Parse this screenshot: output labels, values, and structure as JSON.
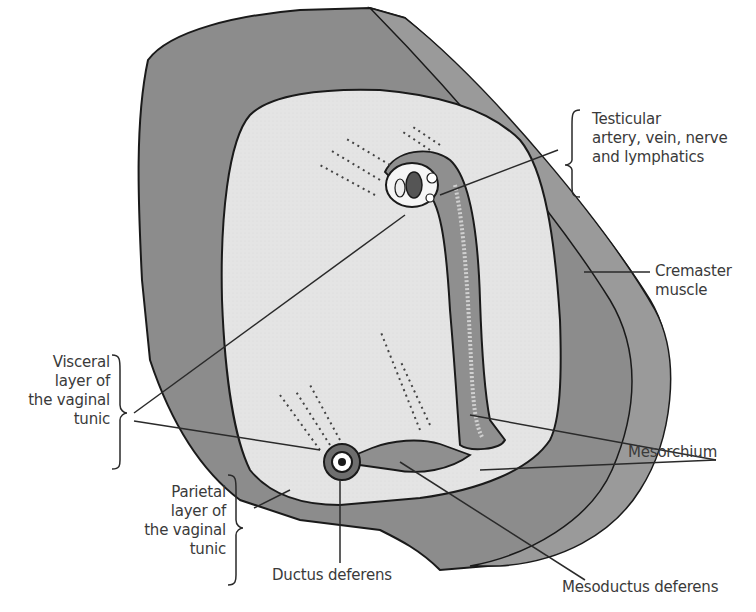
{
  "diagram": {
    "colors": {
      "outer_muscle": "#8a8a8a",
      "inner_cavity": "#e6e6e6",
      "outline": "#1a1a1a",
      "leader_line": "#2a2a2a",
      "text": "#3a3a3a"
    },
    "labels": {
      "testicular": [
        "Testicular",
        "artery, vein, nerve",
        "and lymphatics"
      ],
      "cremaster": [
        "Cremaster",
        "muscle"
      ],
      "visceral": [
        "Visceral",
        "layer of",
        "the vaginal",
        "tunic"
      ],
      "parietal": [
        "Parietal",
        "layer of",
        "the vaginal",
        "tunic"
      ],
      "mesorchium": "Mesorchium",
      "ductus_deferens": "Ductus deferens",
      "mesoductus_deferens": "Mesoductus deferens"
    }
  }
}
